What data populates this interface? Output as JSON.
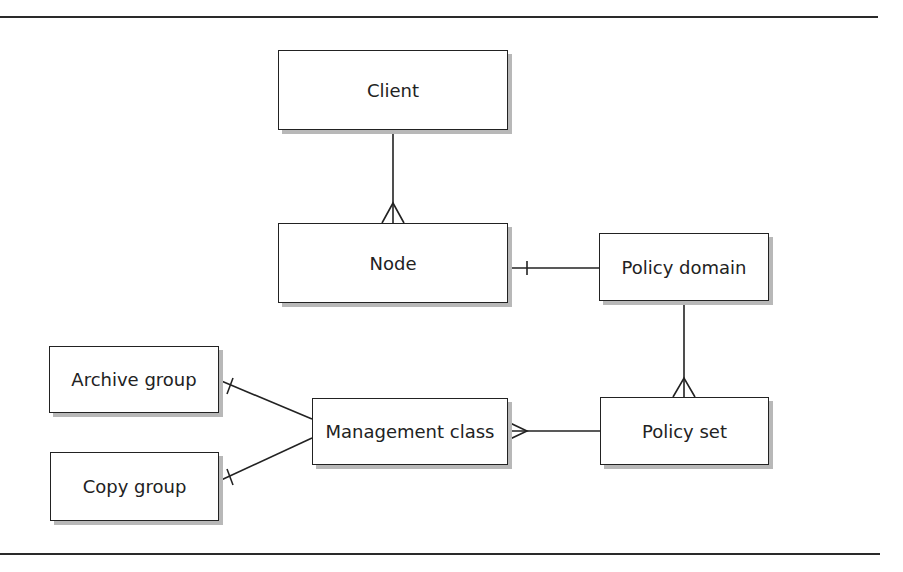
{
  "diagram": {
    "type": "entity-relationship",
    "entities": [
      {
        "id": "client",
        "label": "Client",
        "x": 278,
        "y": 50,
        "w": 230,
        "h": 80
      },
      {
        "id": "node",
        "label": "Node",
        "x": 278,
        "y": 223,
        "w": 230,
        "h": 80
      },
      {
        "id": "policy_domain",
        "label": "Policy domain",
        "x": 599,
        "y": 233,
        "w": 170,
        "h": 68
      },
      {
        "id": "policy_set",
        "label": "Policy set",
        "x": 600,
        "y": 397,
        "w": 169,
        "h": 68
      },
      {
        "id": "management_class",
        "label": "Management class",
        "x": 312,
        "y": 398,
        "w": 196,
        "h": 67
      },
      {
        "id": "archive_group",
        "label": "Archive group",
        "x": 49,
        "y": 346,
        "w": 170,
        "h": 67
      },
      {
        "id": "copy_group",
        "label": "Copy group",
        "x": 50,
        "y": 452,
        "w": 169,
        "h": 69
      }
    ],
    "relationships": [
      {
        "from": "client",
        "to": "node",
        "from_end": "one",
        "to_end": "many"
      },
      {
        "from": "node",
        "to": "policy_domain",
        "from_end": "one",
        "to_end": "none"
      },
      {
        "from": "policy_domain",
        "to": "policy_set",
        "from_end": "one",
        "to_end": "many"
      },
      {
        "from": "policy_set",
        "to": "management_class",
        "from_end": "one",
        "to_end": "many"
      },
      {
        "from": "archive_group",
        "to": "management_class",
        "from_end": "one",
        "to_end": "none"
      },
      {
        "from": "copy_group",
        "to": "management_class",
        "from_end": "one",
        "to_end": "none"
      }
    ]
  },
  "labels": {
    "client": "Client",
    "node": "Node",
    "policy_domain": "Policy domain",
    "policy_set": "Policy set",
    "management_class": "Management class",
    "archive_group": "Archive group",
    "copy_group": "Copy group"
  }
}
